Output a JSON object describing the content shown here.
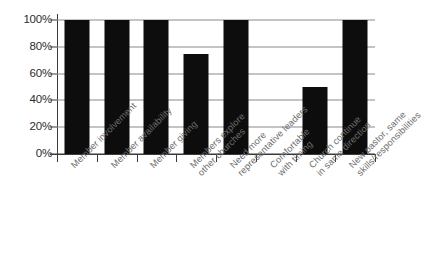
{
  "chart_data": {
    "type": "bar",
    "title": "",
    "subtitle": "",
    "xlabel": "",
    "ylabel": "",
    "ylim": [
      0,
      100
    ],
    "grid": true,
    "legend": null,
    "bar_color": "#0d0d0d",
    "gridline_color": "#8a8a8a",
    "axis_color": "#3a3a3a",
    "label_color": "#6d6d6d",
    "background": "#ffffff",
    "ytick_labels": [
      "100%",
      "80%",
      "60%",
      "40%",
      "20%",
      "0%"
    ],
    "ytick_values": [
      100,
      80,
      60,
      40,
      20,
      0
    ],
    "categories": [
      "Member involvement",
      "Member availability",
      "Member giving",
      "Members explore other churches",
      "Need more representative leaders",
      "Comfortable with timing",
      "Church continue in same direction",
      "New pastor, same skills/responsibilities"
    ],
    "category_lines": [
      [
        "Member involvement"
      ],
      [
        "Member availability"
      ],
      [
        "Member giving"
      ],
      [
        "Members explore",
        "other churches"
      ],
      [
        "Need more",
        "representative leaders"
      ],
      [
        "Comfortable",
        "with timing"
      ],
      [
        "Church continue",
        "in same direction"
      ],
      [
        "New pastor, same",
        "skills/responsibilities"
      ]
    ],
    "values": [
      100,
      100,
      100,
      75,
      100,
      0,
      50,
      100
    ]
  }
}
